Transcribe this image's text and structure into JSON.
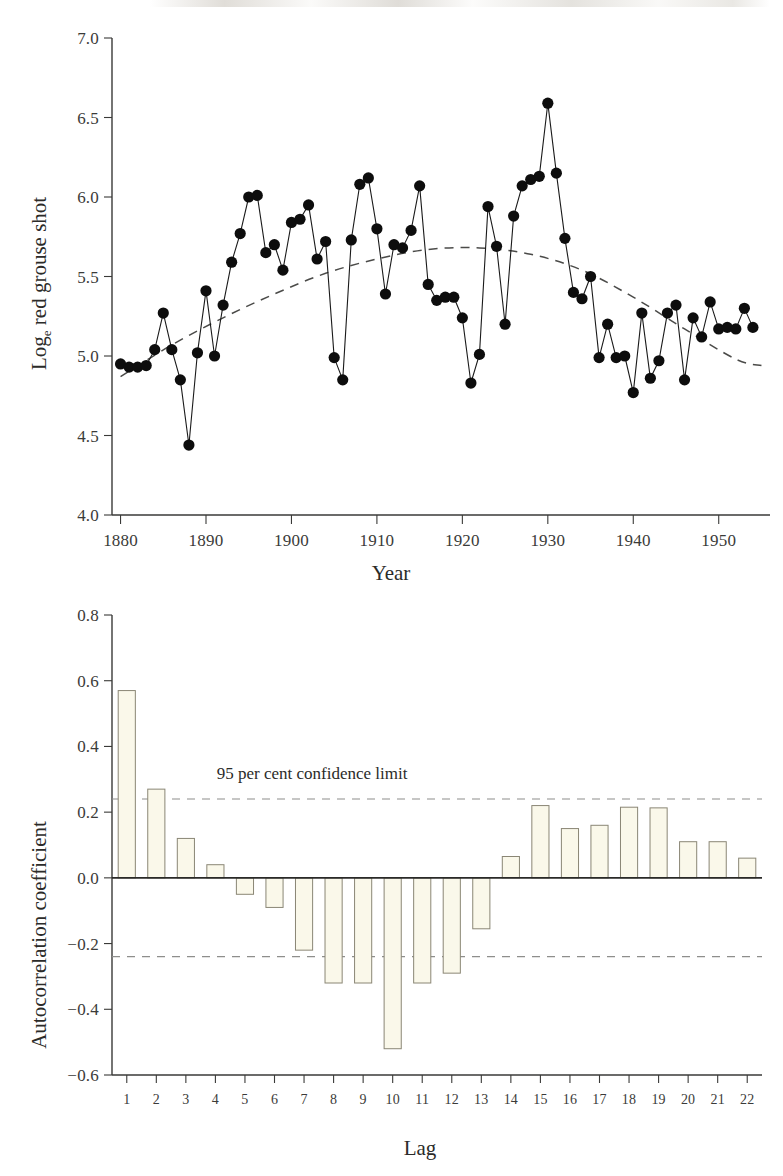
{
  "figure": {
    "background_color": "#ffffff",
    "ink_color": "#231f20",
    "bar_fill_color": "#faf8ea",
    "bar_stroke_color": "#8a8675",
    "dash_color": "#8e8e8c"
  },
  "panels": [
    {
      "id": "timeseries",
      "chart_data": {
        "type": "line",
        "title": "",
        "xlabel": "Year",
        "ylabel": "Log",
        "ylabel_subscript": "e",
        "ylabel_rest": " red grouse shot",
        "xlim": [
          1879,
          1956
        ],
        "ylim": [
          4.0,
          7.0
        ],
        "grid": false,
        "legend": "none",
        "xticks": [
          1880,
          1890,
          1900,
          1910,
          1920,
          1930,
          1940,
          1950
        ],
        "xticklabels": [
          "1880",
          "1890",
          "1900",
          "1910",
          "1920",
          "1930",
          "1940",
          "1950"
        ],
        "yticks": [
          4.0,
          4.5,
          5.0,
          5.5,
          6.0,
          6.5,
          7.0
        ],
        "yticklabels": [
          "4.0",
          "4.5",
          "5.0",
          "5.5",
          "6.0",
          "6.5",
          "7.0"
        ],
        "marker": "filled-circle",
        "x": [
          1880,
          1881,
          1882,
          1883,
          1884,
          1885,
          1886,
          1887,
          1888,
          1889,
          1890,
          1891,
          1892,
          1893,
          1894,
          1895,
          1896,
          1897,
          1898,
          1899,
          1900,
          1901,
          1902,
          1903,
          1904,
          1905,
          1906,
          1907,
          1908,
          1909,
          1910,
          1911,
          1912,
          1913,
          1914,
          1915,
          1916,
          1917,
          1918,
          1919,
          1920,
          1921,
          1922,
          1923,
          1924,
          1925,
          1926,
          1927,
          1928,
          1929,
          1930,
          1931,
          1932,
          1933,
          1934,
          1935,
          1936,
          1937,
          1938,
          1939,
          1940,
          1941,
          1942,
          1943,
          1944,
          1945,
          1946,
          1947,
          1948,
          1949,
          1950,
          1951,
          1952,
          1953,
          1954
        ],
        "y": [
          4.95,
          4.93,
          4.93,
          4.94,
          5.04,
          5.27,
          5.04,
          4.85,
          4.44,
          5.02,
          5.41,
          5.0,
          5.32,
          5.59,
          5.77,
          6.0,
          6.01,
          5.65,
          5.7,
          5.54,
          5.84,
          5.86,
          5.95,
          5.61,
          5.72,
          4.99,
          4.85,
          5.73,
          6.08,
          6.12,
          5.8,
          5.39,
          5.7,
          5.68,
          5.79,
          6.07,
          5.45,
          5.35,
          5.37,
          5.37,
          5.24,
          4.83,
          5.01,
          5.94,
          5.69,
          5.2,
          5.88,
          6.07,
          6.11,
          6.13,
          6.59,
          6.15,
          5.74,
          5.4,
          5.36,
          5.5,
          4.99,
          5.2,
          4.99,
          5.0,
          4.77,
          5.27,
          4.86,
          4.97,
          5.27,
          5.32,
          4.85,
          5.24,
          5.12,
          5.34,
          5.17,
          5.18,
          5.17,
          5.3,
          5.18
        ],
        "trend": {
          "style": "dashed",
          "description": "fitted quadratic trend",
          "x": [
            1880,
            1886,
            1892,
            1898,
            1904,
            1910,
            1916,
            1922,
            1928,
            1934,
            1940,
            1946,
            1952,
            1955
          ],
          "y": [
            4.87,
            5.07,
            5.24,
            5.39,
            5.52,
            5.61,
            5.67,
            5.68,
            5.64,
            5.54,
            5.37,
            5.17,
            4.98,
            4.94
          ]
        }
      }
    },
    {
      "id": "autocorrelation",
      "chart_data": {
        "type": "bar",
        "title": "",
        "xlabel": "Lag",
        "ylabel": "Autocorrelation coefficient",
        "ylim": [
          -0.6,
          0.8
        ],
        "grid": false,
        "legend": "none",
        "yticks": [
          -0.6,
          -0.4,
          -0.2,
          0.0,
          0.2,
          0.4,
          0.6,
          0.8
        ],
        "yticklabels": [
          "−0.6",
          "−0.4",
          "−0.2",
          "0.0",
          "0.2",
          "0.4",
          "0.6",
          "0.8"
        ],
        "categories": [
          "1",
          "2",
          "3",
          "4",
          "5",
          "6",
          "7",
          "8",
          "9",
          "10",
          "11",
          "12",
          "13",
          "14",
          "15",
          "16",
          "17",
          "18",
          "19",
          "20",
          "21",
          "22"
        ],
        "values": [
          0.57,
          0.27,
          0.12,
          0.04,
          -0.05,
          -0.09,
          -0.22,
          -0.32,
          -0.32,
          -0.52,
          -0.32,
          -0.29,
          -0.155,
          0.065,
          0.22,
          0.15,
          0.16,
          0.215,
          0.213,
          0.11,
          0.11,
          0.06
        ],
        "annotations": [
          {
            "text": "95 per cent confidence limit",
            "x_category": "7",
            "y": 0.3
          }
        ],
        "reference_lines": [
          {
            "name": "upper-confidence-limit",
            "value": 0.24,
            "style": "dashed"
          },
          {
            "name": "lower-confidence-limit",
            "value": -0.24,
            "style": "dashed"
          }
        ]
      }
    }
  ]
}
